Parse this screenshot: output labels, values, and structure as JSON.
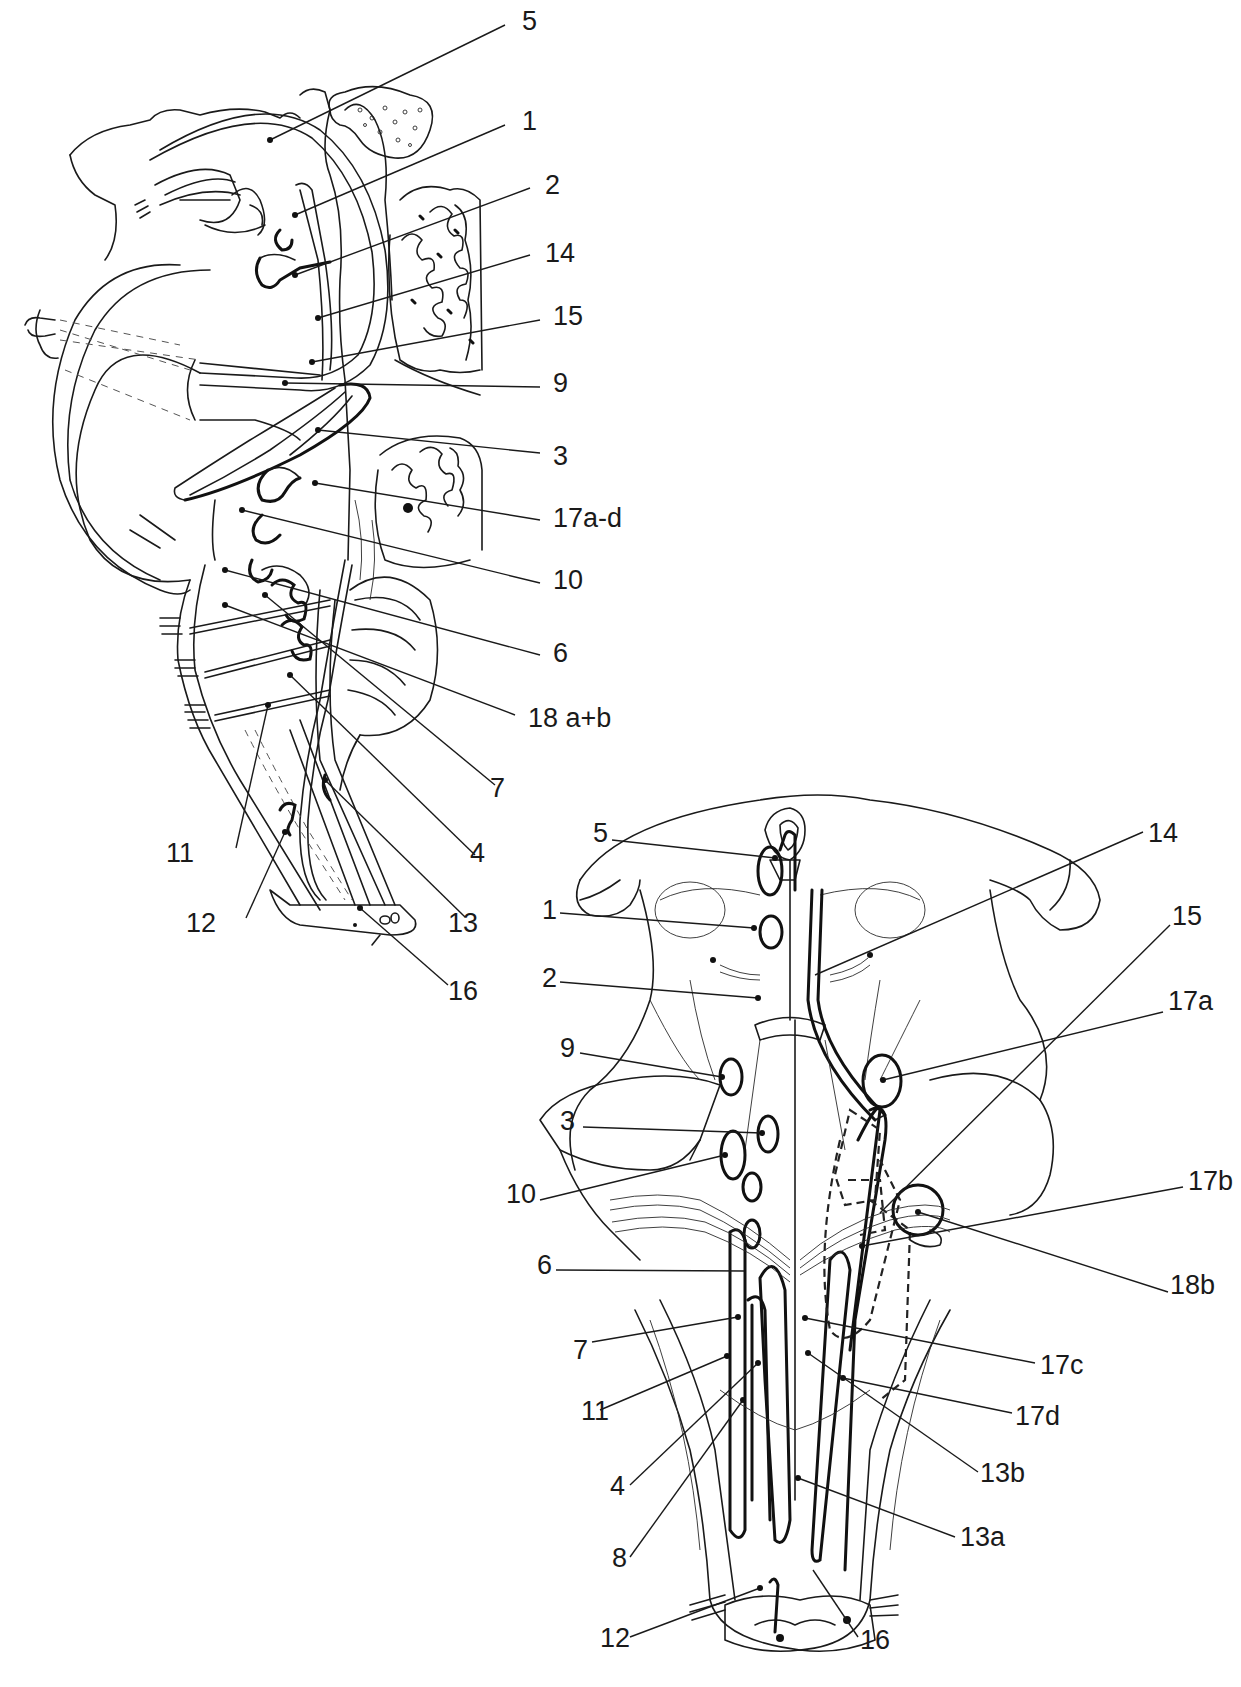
{
  "figure": {
    "panels": [
      {
        "id": "lateral-view",
        "description": "Sagittal/lateral view of brainstem with cranial nerve nuclei",
        "labels": [
          {
            "text": "5",
            "x": 522,
            "y": 8
          },
          {
            "text": "1",
            "x": 522,
            "y": 108
          },
          {
            "text": "2",
            "x": 545,
            "y": 172
          },
          {
            "text": "14",
            "x": 545,
            "y": 240
          },
          {
            "text": "15",
            "x": 553,
            "y": 303
          },
          {
            "text": "9",
            "x": 553,
            "y": 370
          },
          {
            "text": "3",
            "x": 553,
            "y": 443
          },
          {
            "text": "17a-d",
            "x": 553,
            "y": 505
          },
          {
            "text": "10",
            "x": 553,
            "y": 567
          },
          {
            "text": "6",
            "x": 553,
            "y": 640
          },
          {
            "text": "18 a+b",
            "x": 528,
            "y": 705
          },
          {
            "text": "7",
            "x": 490,
            "y": 775
          },
          {
            "text": "11",
            "x": 166,
            "y": 840
          },
          {
            "text": "4",
            "x": 470,
            "y": 840
          },
          {
            "text": "12",
            "x": 186,
            "y": 910
          },
          {
            "text": "13",
            "x": 448,
            "y": 910
          },
          {
            "text": "16",
            "x": 448,
            "y": 978
          }
        ]
      },
      {
        "id": "dorsal-view",
        "description": "Dorsal view of brainstem with cranial nerve nuclei",
        "labels": [
          {
            "text": "5",
            "x": 593,
            "y": 820
          },
          {
            "text": "14",
            "x": 1148,
            "y": 820
          },
          {
            "text": "1",
            "x": 542,
            "y": 897
          },
          {
            "text": "15",
            "x": 1172,
            "y": 903
          },
          {
            "text": "2",
            "x": 542,
            "y": 965
          },
          {
            "text": "17a",
            "x": 1168,
            "y": 988
          },
          {
            "text": "9",
            "x": 560,
            "y": 1035
          },
          {
            "text": "3",
            "x": 560,
            "y": 1108
          },
          {
            "text": "17b",
            "x": 1188,
            "y": 1168
          },
          {
            "text": "10",
            "x": 506,
            "y": 1181
          },
          {
            "text": "6",
            "x": 537,
            "y": 1252
          },
          {
            "text": "18b",
            "x": 1170,
            "y": 1272
          },
          {
            "text": "7",
            "x": 573,
            "y": 1337
          },
          {
            "text": "17c",
            "x": 1040,
            "y": 1352
          },
          {
            "text": "11",
            "x": 581,
            "y": 1398
          },
          {
            "text": "17d",
            "x": 1015,
            "y": 1403
          },
          {
            "text": "13b",
            "x": 980,
            "y": 1460
          },
          {
            "text": "4",
            "x": 610,
            "y": 1473
          },
          {
            "text": "13a",
            "x": 960,
            "y": 1524
          },
          {
            "text": "8",
            "x": 612,
            "y": 1545
          },
          {
            "text": "12",
            "x": 600,
            "y": 1625
          },
          {
            "text": "16",
            "x": 860,
            "y": 1627
          }
        ]
      }
    ]
  }
}
